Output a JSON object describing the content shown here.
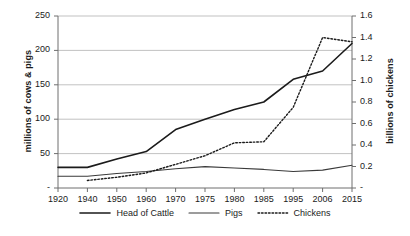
{
  "chart_data": {
    "type": "line",
    "title": "",
    "xlabel": "",
    "ylabel": "millions of cows & pigs",
    "y2label": "billions of chickens",
    "categories": [
      "1920",
      "1940",
      "1950",
      "1960",
      "1970",
      "1975",
      "1980",
      "1985",
      "1995",
      "2006",
      "2015"
    ],
    "ylim": [
      0,
      250
    ],
    "yticks": [
      "-",
      "50",
      "100",
      "150",
      "200",
      "250"
    ],
    "ytick_values": [
      0,
      50,
      100,
      150,
      200,
      250
    ],
    "y2lim": [
      0,
      1.6
    ],
    "y2ticks": [
      "-",
      "0.2",
      "0.4",
      "0.6",
      "0.8",
      "1.0",
      "1.2",
      "1.4",
      "1.6"
    ],
    "y2tick_values": [
      0,
      0.2,
      0.4,
      0.6,
      0.8,
      1.0,
      1.2,
      1.4,
      1.6
    ],
    "grid": true,
    "legend_position": "bottom",
    "series": [
      {
        "name": "Head of Cattle",
        "axis": "left",
        "style": "solid",
        "color": "#1b1b1b",
        "width": 1.6,
        "values": [
          30,
          30,
          42,
          53,
          85,
          100,
          114,
          125,
          158,
          170,
          210
        ]
      },
      {
        "name": "Pigs",
        "axis": "left",
        "style": "solid",
        "color": "#3a3a3a",
        "width": 1.1,
        "values": [
          17,
          17,
          21,
          24,
          28,
          31,
          29,
          27,
          24,
          26,
          33
        ]
      },
      {
        "name": "Chickens",
        "axis": "right",
        "style": "dotted",
        "color": "#1b1b1b",
        "width": 1.4,
        "values": [
          null,
          0.07,
          0.1,
          0.14,
          0.22,
          0.3,
          0.42,
          0.43,
          0.75,
          1.4,
          1.36
        ]
      }
    ]
  },
  "legend": {
    "items": [
      {
        "label": "Head of Cattle",
        "style": "solid-thick"
      },
      {
        "label": "Pigs",
        "style": "solid-thin"
      },
      {
        "label": "Chickens",
        "style": "dotted"
      }
    ]
  }
}
